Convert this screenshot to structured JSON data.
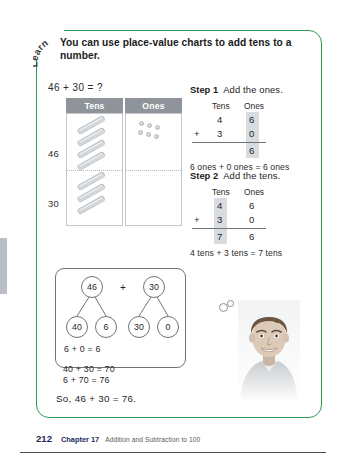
{
  "lesson": {
    "badge": "Learn",
    "heading": "You can use place-value charts to add tens to a number.",
    "problem": "46 + 30 = ?"
  },
  "place_value_chart": {
    "headers": [
      "Tens",
      "Ones"
    ],
    "rows": [
      {
        "label": "46",
        "tens": 4,
        "ones": 6
      },
      {
        "label": "30",
        "tens": 3,
        "ones": 0
      }
    ]
  },
  "steps": [
    {
      "title": "Step 1",
      "description": "Add the ones.",
      "col_headers": [
        "Tens",
        "Ones"
      ],
      "addend1_tens": "4",
      "addend1_ones": "6",
      "operator": "+",
      "addend2_tens": "3",
      "addend2_ones": "0",
      "sum_tens": "",
      "sum_ones": "6",
      "note": "6 ones + 0 ones = 6 ones",
      "highlight": "ones"
    },
    {
      "title": "Step 2",
      "description": "Add the tens.",
      "col_headers": [
        "Tens",
        "Ones"
      ],
      "addend1_tens": "4",
      "addend1_ones": "6",
      "operator": "+",
      "addend2_tens": "3",
      "addend2_ones": "0",
      "sum_tens": "7",
      "sum_ones": "6",
      "note": "4 tens + 3 tens = 7 tens",
      "highlight": "tens"
    }
  ],
  "number_bond": {
    "left_whole": "46",
    "left_parts": [
      "40",
      "6"
    ],
    "operator": "+",
    "right_whole": "30",
    "right_parts": [
      "30",
      "0"
    ],
    "equations": [
      "6 + 0 = 6",
      "40 + 30 = 70",
      "6 + 70 = 76"
    ]
  },
  "conclusion": "So, 46 + 30 = 76.",
  "footer": {
    "page_number": "212",
    "chapter_number": "Chapter 17",
    "chapter_title": "Addition and Subtraction to 100"
  },
  "colors": {
    "card_border": "#2f9b52",
    "header_fill": "#8e9499",
    "page_number": "#1b2b5c"
  }
}
